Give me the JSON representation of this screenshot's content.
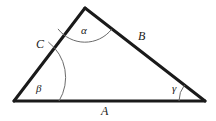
{
  "figure": {
    "kind": "geometry-diagram",
    "shape": "triangle",
    "background_color": "#ffffff",
    "stroke_color": "#1a1a1a",
    "arc_color": "#6b6b6b",
    "edge_width": 3,
    "arc_width": 1
  },
  "vertices": {
    "apex": {
      "name": "apex",
      "x": 85,
      "y": 8
    },
    "bottom_left": {
      "name": "bottom-left",
      "x": 14,
      "y": 101
    },
    "bottom_right": {
      "name": "bottom-right",
      "x": 205,
      "y": 101
    }
  },
  "sides": [
    {
      "id": "a",
      "label": "A",
      "between": [
        "bottom-left",
        "bottom-right"
      ],
      "label_x": 101,
      "label_y": 105
    },
    {
      "id": "b",
      "label": "B",
      "between": [
        "apex",
        "bottom-right"
      ],
      "label_x": 138,
      "label_y": 30
    },
    {
      "id": "c",
      "label": "C",
      "between": [
        "bottom-left",
        "apex"
      ],
      "label_x": 36,
      "label_y": 38
    }
  ],
  "angles": [
    {
      "id": "alpha",
      "label": "α",
      "at_vertex": "apex",
      "arc_radius": 34,
      "label_x": 81,
      "label_y": 25
    },
    {
      "id": "beta",
      "label": "β",
      "at_vertex": "bottom-left",
      "arc_radius": 45,
      "label_x": 36,
      "label_y": 83
    },
    {
      "id": "gamma",
      "label": "γ",
      "at_vertex": "bottom-right",
      "arc_radius": 26,
      "label_x": 172,
      "label_y": 83
    }
  ]
}
